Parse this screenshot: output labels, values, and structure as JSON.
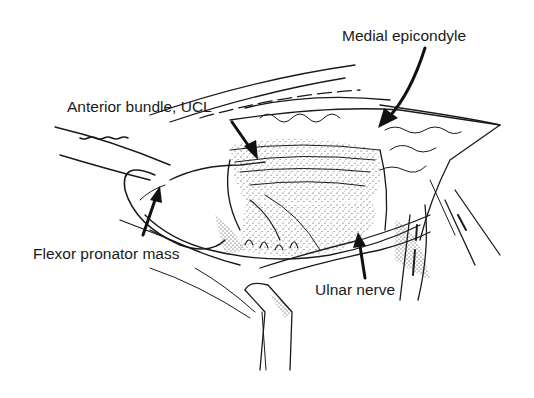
{
  "figure": {
    "labels": {
      "medial_epicondyle": "Medial epicondyle",
      "anterior_bundle_ucl": "Anterior bundle, UCL",
      "flexor_pronator_mass": "Flexor pronator mass",
      "ulnar_nerve": "Ulnar nerve"
    },
    "colors": {
      "ink": "#1a1a1a",
      "background": "#ffffff"
    }
  }
}
